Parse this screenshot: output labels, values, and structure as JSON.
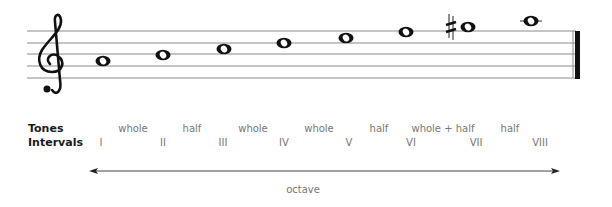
{
  "diagram": {
    "type": "music-scale",
    "clef": "treble",
    "notes": [
      {
        "index": 1,
        "x": 103,
        "y": 61,
        "accidental": null
      },
      {
        "index": 2,
        "x": 163,
        "y": 55,
        "accidental": null
      },
      {
        "index": 3,
        "x": 224,
        "y": 49,
        "accidental": null
      },
      {
        "index": 4,
        "x": 284,
        "y": 43,
        "accidental": null
      },
      {
        "index": 5,
        "x": 346,
        "y": 38,
        "accidental": null
      },
      {
        "index": 6,
        "x": 406,
        "y": 32,
        "accidental": null
      },
      {
        "index": 7,
        "x": 468,
        "y": 27,
        "accidental": "sharp"
      },
      {
        "index": 8,
        "x": 531,
        "y": 21,
        "accidental": null,
        "ledger_line": true
      }
    ],
    "staff_lines_y": [
      31,
      43,
      54,
      66,
      78
    ],
    "ending": "final-barline"
  },
  "labels": {
    "tones": "Tones",
    "intervals": "Intervals",
    "octave": "octave"
  },
  "tones": [
    {
      "label": "whole",
      "x": 133
    },
    {
      "label": "half",
      "x": 192
    },
    {
      "label": "whole",
      "x": 253
    },
    {
      "label": "whole",
      "x": 319
    },
    {
      "label": "half",
      "x": 379
    },
    {
      "label": "whole + half",
      "x": 443
    },
    {
      "label": "half",
      "x": 510
    }
  ],
  "intervals": [
    {
      "label": "I",
      "x": 101
    },
    {
      "label": "II",
      "x": 163
    },
    {
      "label": "III",
      "x": 223
    },
    {
      "label": "IV",
      "x": 284
    },
    {
      "label": "V",
      "x": 349
    },
    {
      "label": "VI",
      "x": 411
    },
    {
      "label": "VII",
      "x": 476
    },
    {
      "label": "VIII",
      "x": 540
    }
  ],
  "colors": {
    "ink": "#111111",
    "staff": "#8a8a8a",
    "text_light": "#777777"
  }
}
